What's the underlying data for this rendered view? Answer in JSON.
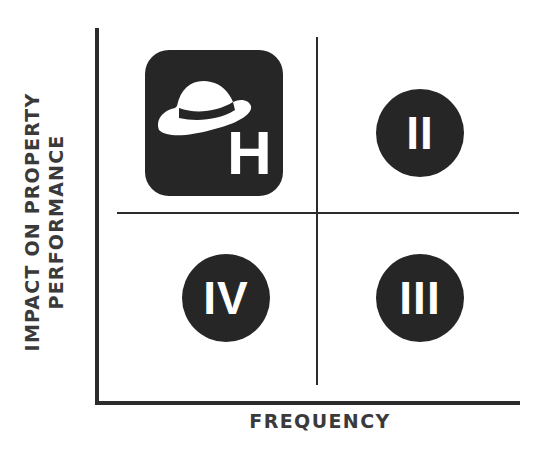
{
  "diagram": {
    "type": "quadrant-matrix",
    "y_axis_label_lines": [
      "IMPACT ON PROPERTY",
      "PERFORMANCE"
    ],
    "x_axis_label": "FREQUENCY",
    "quadrants": [
      {
        "position": "top-left",
        "label": "H",
        "icon": "hat-icon",
        "style": "rounded-square-badge"
      },
      {
        "position": "top-right",
        "label": "II",
        "style": "circle"
      },
      {
        "position": "bottom-left",
        "label": "IV",
        "style": "circle"
      },
      {
        "position": "bottom-right",
        "label": "III",
        "style": "circle"
      }
    ],
    "colors": {
      "badge_fill": "#262626",
      "line": "#2b2b2b",
      "text": "#3a3a3a",
      "glyph": "#ffffff"
    }
  }
}
